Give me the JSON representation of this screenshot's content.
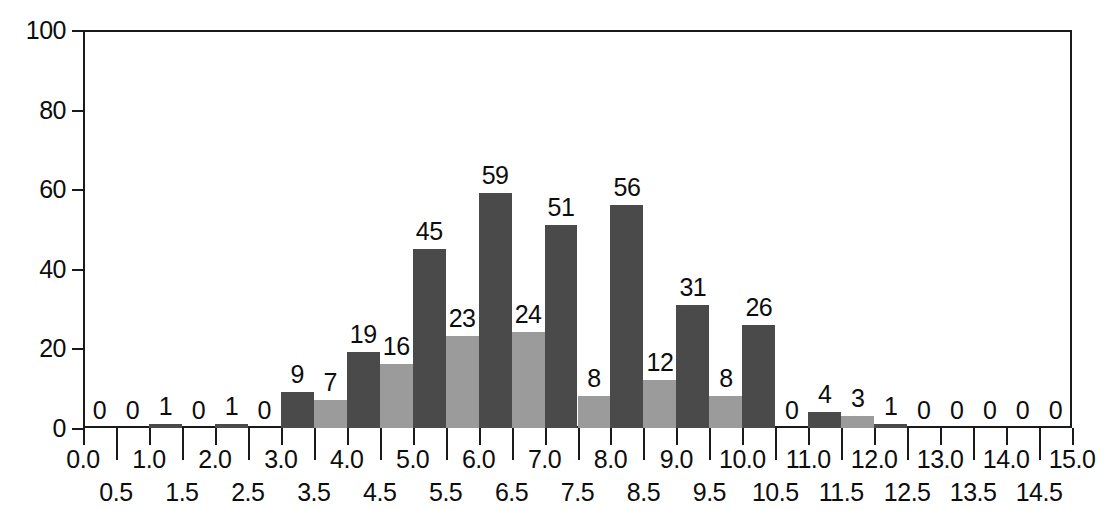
{
  "chart_data": {
    "type": "bar",
    "title": "",
    "subtitle": "",
    "xlabel": "",
    "ylabel": "",
    "grid": false,
    "legend": "none",
    "bin_width": 0.5,
    "xlim": [
      0.0,
      15.0
    ],
    "ylim": [
      0,
      100
    ],
    "y_ticks": [
      0,
      20,
      40,
      60,
      80,
      100
    ],
    "y_tick_labels": [
      "0",
      "20",
      "40",
      "60",
      "80",
      "100"
    ],
    "x_ticks_major": [
      0.0,
      0.5,
      1.0,
      1.5,
      2.0,
      2.5,
      3.0,
      3.5,
      4.0,
      4.5,
      5.0,
      5.5,
      6.0,
      6.5,
      7.0,
      7.5,
      8.0,
      8.5,
      9.0,
      9.5,
      10.0,
      10.5,
      11.0,
      11.5,
      12.0,
      12.5,
      13.0,
      13.5,
      14.0,
      14.5,
      15.0
    ],
    "x_tick_labels_upper": [
      "0.0",
      "1.0",
      "2.0",
      "3.0",
      "4.0",
      "5.0",
      "6.0",
      "7.0",
      "8.0",
      "9.0",
      "10.0",
      "11.0",
      "12.0",
      "13.0",
      "14.0",
      "15.0"
    ],
    "x_tick_values_upper": [
      0.0,
      1.0,
      2.0,
      3.0,
      4.0,
      5.0,
      6.0,
      7.0,
      8.0,
      9.0,
      10.0,
      11.0,
      12.0,
      13.0,
      14.0,
      15.0
    ],
    "x_tick_labels_lower": [
      "0.5",
      "1.5",
      "2.5",
      "3.5",
      "4.5",
      "5.5",
      "6.5",
      "7.5",
      "8.5",
      "9.5",
      "10.5",
      "11.5",
      "12.5",
      "13.5",
      "14.5"
    ],
    "x_tick_values_lower": [
      0.5,
      1.5,
      2.5,
      3.5,
      4.5,
      5.5,
      6.5,
      7.5,
      8.5,
      9.5,
      10.5,
      11.5,
      12.5,
      13.5,
      14.5
    ],
    "categories": [
      "0.0-0.5",
      "0.5-1.0",
      "1.0-1.5",
      "1.5-2.0",
      "2.0-2.5",
      "2.5-3.0",
      "3.0-3.5",
      "3.5-4.0",
      "4.0-4.5",
      "4.5-5.0",
      "5.0-5.5",
      "5.5-6.0",
      "6.0-6.5",
      "6.5-7.0",
      "7.0-7.5",
      "7.5-8.0",
      "8.0-8.5",
      "8.5-9.0",
      "9.0-9.5",
      "9.5-10.0",
      "10.0-10.5",
      "10.5-11.0",
      "11.0-11.5",
      "11.5-12.0",
      "12.0-12.5",
      "12.5-13.0",
      "13.0-13.5",
      "13.5-14.0",
      "14.0-14.5",
      "14.5-15.0"
    ],
    "bin_starts": [
      0.0,
      0.5,
      1.0,
      1.5,
      2.0,
      2.5,
      3.0,
      3.5,
      4.0,
      4.5,
      5.0,
      5.5,
      6.0,
      6.5,
      7.0,
      7.5,
      8.0,
      8.5,
      9.0,
      9.5,
      10.0,
      10.5,
      11.0,
      11.5,
      12.0,
      12.5,
      13.0,
      13.5,
      14.0,
      14.5
    ],
    "values": [
      0,
      0,
      1,
      0,
      1,
      0,
      9,
      7,
      19,
      16,
      45,
      23,
      59,
      24,
      51,
      8,
      56,
      12,
      31,
      8,
      26,
      0,
      4,
      3,
      1,
      0,
      0,
      0,
      0,
      0
    ],
    "bar_labels": [
      "0",
      "0",
      "1",
      "0",
      "1",
      "0",
      "9",
      "7",
      "19",
      "16",
      "45",
      "23",
      "59",
      "24",
      "51",
      "8",
      "56",
      "12",
      "31",
      "8",
      "26",
      "0",
      "4",
      "3",
      "1",
      "0",
      "0",
      "0",
      "0",
      "0"
    ],
    "bar_shades": [
      "dark",
      "light",
      "dark",
      "light",
      "dark",
      "light",
      "dark",
      "light",
      "dark",
      "light",
      "dark",
      "light",
      "dark",
      "light",
      "dark",
      "light",
      "dark",
      "light",
      "dark",
      "light",
      "dark",
      "light",
      "dark",
      "light",
      "dark",
      "light",
      "dark",
      "light",
      "dark",
      "light"
    ],
    "colors": {
      "dark": "#4a4a4a",
      "light": "#9b9b9b",
      "axis": "#1a1a1a",
      "text": "#0d0d0d",
      "background": "#ffffff"
    },
    "total_count": 312
  }
}
